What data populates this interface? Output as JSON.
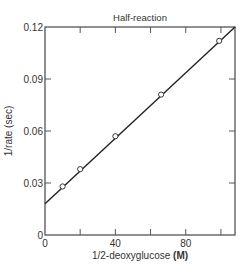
{
  "chart_data": {
    "type": "scatter",
    "title": "Half-reaction",
    "xlabel": "1/2-deoxyglucose",
    "xlabel_unit": "(M)",
    "ylabel": "1/rate (sec)",
    "xlim": [
      0,
      108
    ],
    "ylim": [
      0,
      0.12
    ],
    "x_ticks": [
      0,
      20,
      40,
      60,
      80,
      100
    ],
    "x_tick_labels": [
      "0",
      "",
      "40",
      "",
      "80",
      ""
    ],
    "y_ticks": [
      0,
      0.03,
      0.06,
      0.09,
      0.12
    ],
    "y_tick_labels": [
      "0",
      "0.03",
      "0.06",
      "0.09",
      "0.12"
    ],
    "grid": false,
    "legend": null,
    "series": [
      {
        "name": "Measured points",
        "marker": "open-circle",
        "x": [
          10,
          20,
          40,
          66,
          99
        ],
        "y": [
          0.028,
          0.038,
          0.057,
          0.081,
          0.112
        ]
      },
      {
        "name": "Linear fit",
        "style": "line",
        "x": [
          0,
          108
        ],
        "y": [
          0.018,
          0.12
        ]
      }
    ]
  },
  "colors": {
    "axis": "#555555",
    "line": "#222222",
    "text": "#333333",
    "marker_fill": "#ffffff"
  }
}
